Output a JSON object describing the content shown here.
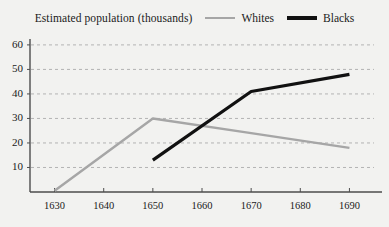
{
  "chart_data": {
    "type": "line",
    "title": "Estimated population (thousands)",
    "xlabel": "",
    "ylabel": "",
    "x": [
      1630,
      1640,
      1650,
      1660,
      1670,
      1680,
      1690
    ],
    "xlim": [
      1625,
      1695
    ],
    "ylim": [
      0,
      62
    ],
    "yticks": [
      10,
      20,
      30,
      40,
      50,
      60
    ],
    "xticks": [
      1630,
      1640,
      1650,
      1660,
      1670,
      1680,
      1690
    ],
    "grid": "horizontal-dashed",
    "legend_position": "top-center",
    "series": [
      {
        "name": "Whites",
        "color": "#a6a6a6",
        "x": [
          1630,
          1650,
          1670,
          1690
        ],
        "values": [
          0.5,
          30,
          24,
          18
        ]
      },
      {
        "name": "Blacks",
        "color": "#111111",
        "x": [
          1650,
          1670,
          1690
        ],
        "values": [
          13,
          41,
          48
        ]
      }
    ]
  },
  "legend": {
    "whites_label": "Whites",
    "blacks_label": "Blacks",
    "whites_color": "#a6a6a6",
    "blacks_color": "#111111"
  },
  "axes": {
    "ytick_labels": [
      "60",
      "50",
      "40",
      "30",
      "20",
      "10"
    ],
    "xtick_labels": [
      "1630",
      "1640",
      "1650",
      "1660",
      "1670",
      "1680",
      "1690"
    ],
    "axis_color": "#4d4d4d",
    "grid_color": "#b3b3b3"
  },
  "background_color": "#f2f2f0"
}
